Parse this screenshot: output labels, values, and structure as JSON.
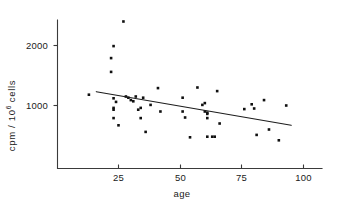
{
  "figure": {
    "kind": "scatter-plot-with-regression-line",
    "background_color": "#ffffff",
    "ink_color": "#1a1a1a"
  },
  "axes": {
    "x_title": "age",
    "y_title_parts": {
      "prefix": "cpm / 10",
      "exponent": "6",
      "suffix": "cells"
    },
    "x_ticklabels": [
      "25",
      "50",
      "75",
      "100"
    ],
    "y_ticklabels": [
      "1000",
      "2000"
    ]
  },
  "chart_data": {
    "type": "scatter",
    "title": "",
    "xlabel": "age",
    "ylabel": "cpm / 10^6 cells",
    "xlim": [
      8,
      113
    ],
    "ylim": [
      250,
      2550
    ],
    "xticks": [
      25,
      50,
      75,
      100
    ],
    "yticks": [
      1000,
      2000
    ],
    "grid": false,
    "legend": null,
    "series": [
      {
        "name": "subjects",
        "marker": "square",
        "marker_color": "#101010",
        "points": [
          [
            13,
            1180
          ],
          [
            22,
            1790
          ],
          [
            22,
            1560
          ],
          [
            23,
            1990
          ],
          [
            23,
            1120
          ],
          [
            23,
            960
          ],
          [
            23,
            930
          ],
          [
            23,
            790
          ],
          [
            24,
            1060
          ],
          [
            25,
            670
          ],
          [
            27,
            2400
          ],
          [
            28,
            1150
          ],
          [
            29,
            1130
          ],
          [
            30,
            1090
          ],
          [
            31,
            1070
          ],
          [
            32,
            1150
          ],
          [
            33,
            930
          ],
          [
            34,
            960
          ],
          [
            34,
            790
          ],
          [
            35,
            1130
          ],
          [
            36,
            560
          ],
          [
            38,
            1010
          ],
          [
            41,
            1290
          ],
          [
            42,
            900
          ],
          [
            51,
            1130
          ],
          [
            51,
            900
          ],
          [
            52,
            800
          ],
          [
            54,
            470
          ],
          [
            57,
            1300
          ],
          [
            59,
            1010
          ],
          [
            60,
            1040
          ],
          [
            60,
            900
          ],
          [
            61,
            880
          ],
          [
            61,
            860
          ],
          [
            61,
            790
          ],
          [
            61,
            480
          ],
          [
            63,
            480
          ],
          [
            64,
            480
          ],
          [
            65,
            1240
          ],
          [
            66,
            700
          ],
          [
            76,
            940
          ],
          [
            79,
            1020
          ],
          [
            80,
            950
          ],
          [
            81,
            510
          ],
          [
            84,
            1090
          ],
          [
            86,
            600
          ],
          [
            90,
            420
          ],
          [
            93,
            1000
          ]
        ]
      }
    ],
    "trend_line": {
      "name": "regression-line",
      "color": "#1d1d1d",
      "x_start": 16,
      "y_start": 1230,
      "x_end": 95,
      "y_end": 670
    }
  }
}
